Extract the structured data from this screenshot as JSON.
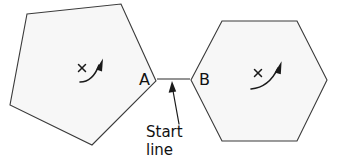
{
  "figure": {
    "background_color": "#ffffff",
    "shape_fill_color": "#f7f7f7",
    "shape_stroke_color": "#3a3a3a",
    "ink_color": "#1a1a1a",
    "labels": {
      "vertex_a": "A",
      "vertex_b": "B",
      "caption_line1": "Start",
      "caption_line2": "line"
    },
    "shapes": [
      {
        "name": "pentagon",
        "sides": 5,
        "vertex_label": "A",
        "points": "27,14 121,4 156,81 92,145 10,105",
        "mark": {
          "type": "x-and-rotation-arrow",
          "x_center": [
            82,
            68
          ],
          "arrow_from": [
            82,
            82
          ],
          "arrow_to": [
            101,
            61
          ]
        }
      },
      {
        "name": "hexagon",
        "sides": 6,
        "vertex_label": "B",
        "points": "222,21 297,21 327,80 297,141 222,141 191,80",
        "mark": {
          "type": "x-and-rotation-arrow",
          "x_center": [
            258,
            73
          ],
          "arrow_from": [
            252,
            89
          ],
          "arrow_to": [
            280,
            65
          ]
        }
      }
    ],
    "start_line": {
      "name": "start-line",
      "from": [
        157,
        79
      ],
      "to": [
        190,
        79
      ],
      "annotation_arrow_from": [
        178,
        123
      ],
      "annotation_arrow_to": [
        172,
        84
      ]
    }
  }
}
